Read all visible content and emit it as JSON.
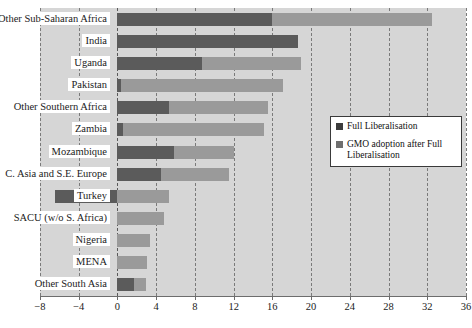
{
  "title": "",
  "legend": {
    "position": "inside-right",
    "items": [
      {
        "label": "Full Liberalisation",
        "color": "#3c3c3c",
        "name": "legend-full-liberalisation"
      },
      {
        "label": "GMO adoption after Full Liberalisation",
        "color": "#6f6f6f",
        "name": "legend-gmo-adoption"
      }
    ]
  },
  "axis": {
    "xlabel": "",
    "ylabel": "",
    "ticks": [
      "-8",
      "-4",
      "0",
      "4",
      "8",
      "12",
      "16",
      "20",
      "24",
      "28",
      "32",
      "36"
    ],
    "min": -8,
    "max": 36,
    "step": 4
  },
  "colors": {
    "plot_background": "#d6d6d6",
    "series_full_liberalisation": "#5b5b5b",
    "series_gmo_adoption": "#9a9a9a",
    "gridline": "#7a7a7a",
    "axis": "#6d6d6d",
    "label_background": "#ffffff",
    "text": "#1b1b1b"
  },
  "chart_data": {
    "type": "bar",
    "orientation": "horizontal",
    "stacked": true,
    "title": "",
    "xlabel": "",
    "ylabel": "",
    "xlim": [
      -8,
      36
    ],
    "grid": true,
    "legend_position": "inside-right",
    "categories": [
      "Other Sub-Saharan Africa",
      "India",
      "Uganda",
      "Pakistan",
      "Other Southern Africa",
      "Zambia",
      "Mozambique",
      "C. Asia and S.E. Europe",
      "Turkey",
      "SACU (w/o S. Africa)",
      "Nigeria",
      "MENA",
      "Other South Asia"
    ],
    "series": [
      {
        "name": "Full Liberalisation",
        "color": "#5b5b5b",
        "values": [
          16.0,
          18.6,
          8.7,
          0.4,
          5.3,
          0.6,
          5.8,
          4.5,
          -6.5,
          0.0,
          0.0,
          0.0,
          1.7
        ]
      },
      {
        "name": "GMO adoption after Full Liberalisation",
        "color": "#9a9a9a",
        "values": [
          16.5,
          0.0,
          10.3,
          16.7,
          10.3,
          14.5,
          6.2,
          7.0,
          5.3,
          4.8,
          3.4,
          3.1,
          1.2
        ]
      }
    ],
    "totals": [
      32.5,
      18.6,
      19.0,
      17.1,
      15.6,
      15.1,
      12.0,
      11.5,
      5.3,
      4.8,
      3.4,
      3.1,
      2.9
    ]
  }
}
